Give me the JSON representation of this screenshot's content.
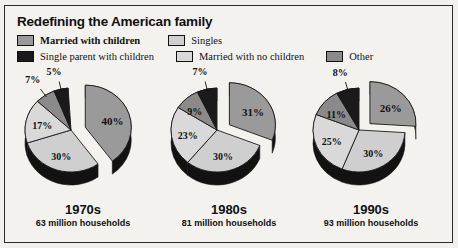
{
  "title": "Redefining the American family",
  "legend": {
    "rows": [
      [
        {
          "label": "Married with children",
          "color": "#9a9a9a",
          "bold": true
        },
        {
          "label": "Singles",
          "color": "#cfcfcf",
          "bold": false
        }
      ],
      [
        {
          "label": "Single parent with children",
          "color": "#1a1a1a",
          "bold": false
        },
        {
          "label": "Married with no children",
          "color": "#d9d9d9",
          "bold": false
        },
        {
          "label": "Other",
          "color": "#8a8a8a",
          "bold": false
        }
      ]
    ]
  },
  "chart_data": {
    "type": "pie",
    "title": "Redefining the American family",
    "categories": [
      "Married with children",
      "Singles",
      "Single parent with children",
      "Married with no children",
      "Other"
    ],
    "colors": [
      "#9a9a9a",
      "#cfcfcf",
      "#1a1a1a",
      "#d9d9d9",
      "#8a8a8a"
    ],
    "legend_position": "top",
    "charts": [
      {
        "decade": "1970s",
        "households": "63 million households",
        "exploded": "Married with children",
        "slices": [
          {
            "category": "Married with children",
            "value": 40,
            "label": "40%"
          },
          {
            "category": "Singles",
            "value": 30,
            "label": "30%"
          },
          {
            "category": "Married with no children",
            "value": 17,
            "label": "17%"
          },
          {
            "category": "Other",
            "value": 7,
            "label": "7%"
          },
          {
            "category": "Single parent with children",
            "value": 5,
            "label": "5%"
          }
        ]
      },
      {
        "decade": "1980s",
        "households": "81 million households",
        "exploded": "Married with children",
        "slices": [
          {
            "category": "Married with children",
            "value": 31,
            "label": "31%"
          },
          {
            "category": "Singles",
            "value": 30,
            "label": "30%"
          },
          {
            "category": "Married with no children",
            "value": 23,
            "label": "23%"
          },
          {
            "category": "Other",
            "value": 9,
            "label": "9%"
          },
          {
            "category": "Single parent with children",
            "value": 7,
            "label": "7%"
          }
        ]
      },
      {
        "decade": "1990s",
        "households": "93 million households",
        "exploded": "Married with children",
        "slices": [
          {
            "category": "Married with children",
            "value": 26,
            "label": "26%"
          },
          {
            "category": "Singles",
            "value": 30,
            "label": "30%"
          },
          {
            "category": "Married with no children",
            "value": 25,
            "label": "25%"
          },
          {
            "category": "Other",
            "value": 11,
            "label": "11%"
          },
          {
            "category": "Single parent with children",
            "value": 8,
            "label": "8%"
          }
        ]
      }
    ]
  }
}
